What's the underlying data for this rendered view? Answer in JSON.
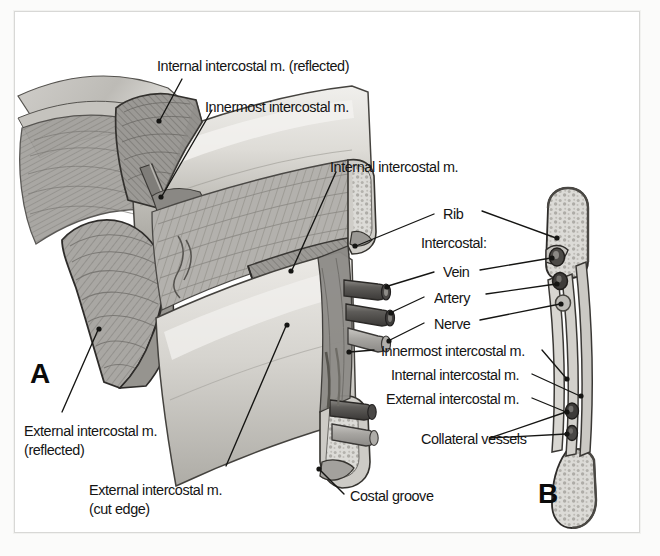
{
  "figure": {
    "type": "anatomical-illustration",
    "style": "grayscale medical illustration",
    "panels": [
      {
        "id": "A",
        "letter": "A",
        "description": "Cutaway dissection of the intercostal space between two ribs with muscle layers reflected"
      },
      {
        "id": "B",
        "letter": "B",
        "description": "Cross-section of rib and intercostal space showing muscle layers and vessels"
      }
    ]
  },
  "labels": {
    "internal_reflected": "Internal intercostal m. (reflected)",
    "innermost_top": "Innermost intercostal m.",
    "internal_mid": "Internal intercostal m.",
    "rib": "Rib",
    "intercostal_header": "Intercostal:",
    "vein": "Vein",
    "artery": "Artery",
    "nerve": "Nerve",
    "innermost_b": "Innermost intercostal m.",
    "internal_b": "Internal intercostal m.",
    "external_b": "External intercostal m.",
    "collateral_vessels": "Collateral vessels",
    "external_reflected_l1": "External intercostal m.",
    "external_reflected_l2": "(reflected)",
    "external_cut_l1": "External intercostal m.",
    "external_cut_l2": "(cut edge)",
    "costal_groove": "Costal groove"
  },
  "panel_letters": {
    "a": "A",
    "b": "B"
  },
  "colors": {
    "page_background": "#fbfbfa",
    "panel_background": "#ffffff",
    "frame_border": "#d8d8d6",
    "label_text": "#141414",
    "leader_line": "#1a1a1a",
    "bone_fill": "#d9d8d4",
    "bone_shade": "#bcbab4",
    "muscle_fill": "#a8a6a2",
    "muscle_dark": "#8a8885",
    "vessel_dark": "#4a4846",
    "vessel_light": "#b5b3af",
    "outline": "#2a2a28"
  }
}
